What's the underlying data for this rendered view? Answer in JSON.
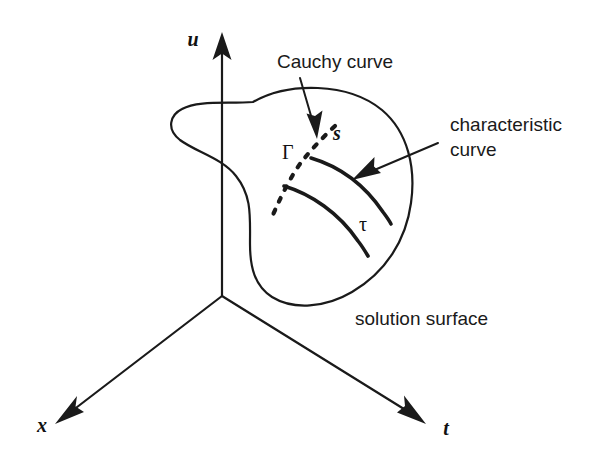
{
  "figure": {
    "background_color": "#ffffff",
    "ink_color": "#1a1a1a",
    "width": 590,
    "height": 462
  },
  "axes": {
    "vertical": {
      "label": "u",
      "name": "u-axis",
      "direction": "up"
    },
    "left": {
      "label": "x",
      "name": "x-axis",
      "direction": "down-left"
    },
    "right": {
      "label": "t",
      "name": "t-axis",
      "direction": "down-right"
    },
    "origin": {
      "x": 222,
      "y": 296
    }
  },
  "annotations": {
    "cauchy": {
      "label": "Cauchy curve",
      "points_to": "dashed-curve"
    },
    "characteristic": {
      "line1": "characteristic",
      "line2": "curve",
      "points_to": "solid-curve"
    },
    "surface": {
      "label": "solution surface"
    }
  },
  "curve_labels": {
    "gamma": "Γ",
    "s": "s",
    "tau": "τ"
  }
}
